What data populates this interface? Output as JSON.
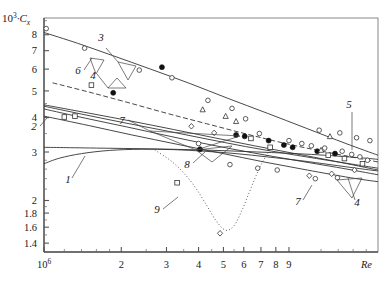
{
  "chart_data": {
    "type": "line",
    "title": "",
    "xlabel": "Re",
    "ylabel": "10^3·C_x",
    "ylabel_parts": {
      "base": "10",
      "exp": "3",
      "dot": "·",
      "sym": "C",
      "sub": "x"
    },
    "xscale": "log",
    "yscale": "log",
    "xlim": [
      1000000,
      20000000
    ],
    "ylim": [
      1.3,
      9.2
    ],
    "grid": false,
    "legend": "none",
    "xticks_major": [
      {
        "value": 1000000,
        "label": "10",
        "exp": "6"
      },
      {
        "value": 2000000,
        "label": "2"
      },
      {
        "value": 3000000,
        "label": "3"
      },
      {
        "value": 4000000,
        "label": "4"
      },
      {
        "value": 5000000,
        "label": "5"
      },
      {
        "value": 6000000,
        "label": "6"
      },
      {
        "value": 7000000,
        "label": "7"
      },
      {
        "value": 8000000,
        "label": "8"
      },
      {
        "value": 9000000,
        "label": "9"
      }
    ],
    "xticks_minor": [
      1200000,
      1400000,
      1600000,
      1800000,
      2500000,
      3500000,
      4500000,
      5500000,
      12000000,
      14000000,
      16000000,
      18000000
    ],
    "yticks": [
      {
        "value": 8,
        "label": "8"
      },
      {
        "value": 7,
        "label": "7"
      },
      {
        "value": 6,
        "label": "6"
      },
      {
        "value": 5,
        "label": "5"
      },
      {
        "value": 4,
        "label": "4"
      },
      {
        "value": 3,
        "label": "3"
      },
      {
        "value": 2,
        "label": "2"
      },
      {
        "value": 1.8,
        "label": "1.8"
      },
      {
        "value": 1.6,
        "label": "1.6"
      },
      {
        "value": 1.4,
        "label": "1.4"
      }
    ],
    "yticks_minor": [
      9,
      4.5,
      3.5,
      2.8,
      2.6,
      2.4,
      2.2,
      1.5,
      1.7,
      1.9
    ],
    "curve_labels": [
      {
        "id": "1",
        "text": "1",
        "x": 68,
        "y": 183
      },
      {
        "id": "2",
        "text": "2",
        "x": 34,
        "y": 130
      },
      {
        "id": "3",
        "text": "3",
        "x": 101,
        "y": 41
      },
      {
        "id": "4a",
        "text": "4",
        "x": 93,
        "y": 79
      },
      {
        "id": "5",
        "text": "5",
        "x": 349,
        "y": 108
      },
      {
        "id": "6",
        "text": "6",
        "x": 78,
        "y": 74
      },
      {
        "id": "7a",
        "text": "7",
        "x": 122,
        "y": 124
      },
      {
        "id": "7b",
        "text": "7",
        "x": 298,
        "y": 205
      },
      {
        "id": "8",
        "text": "8",
        "x": 187,
        "y": 168
      },
      {
        "id": "9",
        "text": "9",
        "x": 157,
        "y": 213
      },
      {
        "id": "4b",
        "text": "4",
        "x": 357,
        "y": 206
      }
    ],
    "series": [
      {
        "name": "1",
        "style": "solid",
        "points": [
          [
            1000000,
            2.72
          ],
          [
            1150000,
            2.85
          ],
          [
            1400000,
            2.96
          ],
          [
            1800000,
            3.04
          ],
          [
            2400000,
            3.07
          ],
          [
            3200000,
            3.06
          ],
          [
            4200000,
            3.02
          ],
          [
            5600000,
            2.96
          ],
          [
            7400000,
            2.88
          ],
          [
            10000000,
            2.79
          ],
          [
            13000000,
            2.7
          ],
          [
            17000000,
            2.61
          ],
          [
            20000000,
            2.56
          ]
        ]
      },
      {
        "name": "2",
        "style": "solid",
        "points": [
          [
            1000000,
            4.45
          ],
          [
            1500000,
            4.15
          ],
          [
            2200000,
            3.88
          ],
          [
            3200000,
            3.62
          ],
          [
            4600000,
            3.38
          ],
          [
            6600000,
            3.16
          ],
          [
            9500000,
            2.96
          ],
          [
            13500000,
            2.78
          ],
          [
            20000000,
            2.58
          ]
        ]
      },
      {
        "name": "3",
        "style": "solid",
        "points": [
          [
            1000000,
            8.15
          ],
          [
            1350000,
            7.45
          ],
          [
            1850000,
            6.72
          ],
          [
            2600000,
            6.0
          ],
          [
            3700000,
            5.32
          ],
          [
            5200000,
            4.7
          ],
          [
            7400000,
            4.15
          ],
          [
            10500000,
            3.66
          ],
          [
            15000000,
            3.22
          ],
          [
            20000000,
            2.92
          ]
        ]
      },
      {
        "name": "4",
        "style": "dashed",
        "points": [
          [
            1080000,
            5.35
          ],
          [
            1500000,
            4.95
          ],
          [
            2100000,
            4.55
          ],
          [
            3000000,
            4.15
          ],
          [
            4300000,
            3.8
          ],
          [
            6200000,
            3.48
          ],
          [
            9000000,
            3.2
          ],
          [
            13000000,
            2.98
          ],
          [
            20000000,
            2.76
          ]
        ]
      },
      {
        "name": "5",
        "style": "solid",
        "points": [
          [
            1000000,
            4.4
          ],
          [
            1400000,
            4.12
          ],
          [
            2000000,
            3.85
          ],
          [
            2900000,
            3.6
          ],
          [
            4200000,
            3.36
          ],
          [
            6100000,
            3.14
          ],
          [
            8800000,
            2.96
          ],
          [
            12700000,
            2.8
          ],
          [
            20000000,
            2.62
          ]
        ]
      },
      {
        "name": "6",
        "style": "solid",
        "points": [
          [
            1000000,
            4.3
          ],
          [
            1450000,
            3.98
          ],
          [
            2100000,
            3.7
          ],
          [
            3100000,
            3.42
          ],
          [
            4500000,
            3.18
          ],
          [
            6500000,
            2.98
          ],
          [
            9500000,
            2.8
          ],
          [
            13800000,
            2.64
          ],
          [
            20000000,
            2.48
          ]
        ]
      },
      {
        "name": "7",
        "style": "solid",
        "points": [
          [
            1000000,
            4.05
          ],
          [
            1500000,
            3.74
          ],
          [
            2200000,
            3.46
          ],
          [
            3300000,
            3.2
          ],
          [
            4900000,
            2.97
          ],
          [
            7200000,
            2.76
          ],
          [
            10600000,
            2.58
          ],
          [
            15600000,
            2.42
          ],
          [
            20000000,
            2.34
          ]
        ]
      },
      {
        "name": "8",
        "style": "solid",
        "points": [
          [
            1000000,
            3.12
          ],
          [
            1600000,
            3.1
          ],
          [
            2600000,
            3.08
          ],
          [
            4200000,
            3.05
          ],
          [
            6800000,
            3.0
          ],
          [
            11000000,
            2.94
          ],
          [
            17000000,
            2.86
          ],
          [
            20000000,
            2.82
          ]
        ]
      },
      {
        "name": "9",
        "style": "dotted",
        "points": [
          [
            2700000,
            3.05
          ],
          [
            3100000,
            2.8
          ],
          [
            3500000,
            2.52
          ],
          [
            3900000,
            2.22
          ],
          [
            4300000,
            1.92
          ],
          [
            4700000,
            1.68
          ],
          [
            5100000,
            1.56
          ],
          [
            5500000,
            1.62
          ],
          [
            5900000,
            1.84
          ],
          [
            6300000,
            2.14
          ],
          [
            6700000,
            2.46
          ],
          [
            7100000,
            2.76
          ],
          [
            7500000,
            3.0
          ],
          [
            7800000,
            3.18
          ]
        ]
      }
    ],
    "markers": [
      {
        "type": "open-circle",
        "x": 1020000,
        "y": 8.42
      },
      {
        "type": "open-circle",
        "x": 1440000,
        "y": 7.15
      },
      {
        "type": "open-circle",
        "x": 2350000,
        "y": 5.95
      },
      {
        "type": "open-circle",
        "x": 3150000,
        "y": 5.58
      },
      {
        "type": "filled-circle",
        "x": 1860000,
        "y": 4.92
      },
      {
        "type": "filled-circle",
        "x": 2880000,
        "y": 6.1
      },
      {
        "type": "open-square",
        "x": 1530000,
        "y": 5.25
      },
      {
        "type": "open-square",
        "x": 1320000,
        "y": 4.05
      },
      {
        "type": "open-circle",
        "x": 4350000,
        "y": 4.62
      },
      {
        "type": "open-triangle",
        "x": 4150000,
        "y": 4.28
      },
      {
        "type": "open-triangle",
        "x": 5100000,
        "y": 4.05
      },
      {
        "type": "open-circle",
        "x": 5400000,
        "y": 4.32
      },
      {
        "type": "open-triangle",
        "x": 5600000,
        "y": 3.88
      },
      {
        "type": "open-circle",
        "x": 6100000,
        "y": 3.96
      },
      {
        "type": "open-diamond",
        "x": 3750000,
        "y": 3.72
      },
      {
        "type": "open-diamond",
        "x": 4600000,
        "y": 3.52
      },
      {
        "type": "filled-circle",
        "x": 5600000,
        "y": 3.46
      },
      {
        "type": "filled-circle",
        "x": 6050000,
        "y": 3.42
      },
      {
        "type": "open-square",
        "x": 6400000,
        "y": 3.36
      },
      {
        "type": "open-circle",
        "x": 6900000,
        "y": 3.5
      },
      {
        "type": "filled-circle",
        "x": 7500000,
        "y": 3.3
      },
      {
        "type": "open-square",
        "x": 7600000,
        "y": 3.12
      },
      {
        "type": "filled-circle",
        "x": 8600000,
        "y": 3.18
      },
      {
        "type": "filled-circle",
        "x": 9300000,
        "y": 3.12
      },
      {
        "type": "open-circle",
        "x": 9000000,
        "y": 3.3
      },
      {
        "type": "open-circle",
        "x": 10100000,
        "y": 3.22
      },
      {
        "type": "open-circle",
        "x": 11000000,
        "y": 3.16
      },
      {
        "type": "filled-circle",
        "x": 11600000,
        "y": 3.02
      },
      {
        "type": "open-circle",
        "x": 12400000,
        "y": 3.1
      },
      {
        "type": "open-triangle",
        "x": 12000000,
        "y": 3.05
      },
      {
        "type": "open-square",
        "x": 12800000,
        "y": 2.92
      },
      {
        "type": "filled-circle",
        "x": 13600000,
        "y": 2.96
      },
      {
        "type": "open-circle",
        "x": 14500000,
        "y": 3.02
      },
      {
        "type": "open-square",
        "x": 14800000,
        "y": 2.84
      },
      {
        "type": "open-circle",
        "x": 15800000,
        "y": 2.94
      },
      {
        "type": "open-circle",
        "x": 17000000,
        "y": 2.88
      },
      {
        "type": "open-square",
        "x": 17400000,
        "y": 2.72
      },
      {
        "type": "open-circle",
        "x": 18200000,
        "y": 2.8
      },
      {
        "type": "open-diamond",
        "x": 16200000,
        "y": 2.58
      },
      {
        "type": "open-diamond",
        "x": 13200000,
        "y": 2.5
      },
      {
        "type": "open-diamond",
        "x": 10800000,
        "y": 2.46
      },
      {
        "type": "open-circle",
        "x": 8100000,
        "y": 2.58
      },
      {
        "type": "open-circle",
        "x": 6800000,
        "y": 2.62
      },
      {
        "type": "open-circle",
        "x": 5300000,
        "y": 2.7
      },
      {
        "type": "open-square",
        "x": 3300000,
        "y": 2.32
      },
      {
        "type": "open-diamond",
        "x": 4850000,
        "y": 1.52
      },
      {
        "type": "filled-circle",
        "x": 4050000,
        "y": 3.07
      },
      {
        "type": "open-circle",
        "x": 4000000,
        "y": 3.22
      },
      {
        "type": "open-square",
        "x": 1200000,
        "y": 4.02
      },
      {
        "type": "open-circle",
        "x": 13900000,
        "y": 2.42
      },
      {
        "type": "open-circle",
        "x": 11400000,
        "y": 2.4
      },
      {
        "type": "open-triangle",
        "x": 13000000,
        "y": 3.42
      },
      {
        "type": "open-circle",
        "x": 14200000,
        "y": 3.52
      },
      {
        "type": "open-circle",
        "x": 16500000,
        "y": 3.38
      },
      {
        "type": "open-circle",
        "x": 18600000,
        "y": 3.3
      },
      {
        "type": "open-circle",
        "x": 11800000,
        "y": 3.6
      }
    ]
  }
}
